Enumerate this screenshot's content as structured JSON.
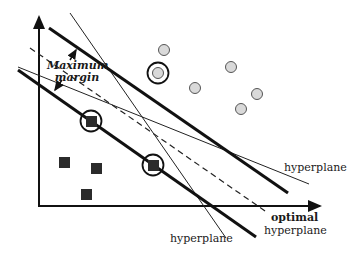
{
  "diagram": {
    "labels": {
      "max_margin_line1": "Maximum",
      "max_margin_line2": "margin",
      "hyperplane_right": "hyperplane",
      "hyperplane_bottom": "hyperplane",
      "optimal": "optimal",
      "optimal_hyperplane": "hyperplane"
    },
    "colors": {
      "line": "#111111",
      "circle_fill": "#d9d9d9",
      "circle_stroke": "#555555",
      "square_fill": "#2b2b2b"
    },
    "class_circles": [
      {
        "x": 164,
        "y": 50
      },
      {
        "x": 231,
        "y": 67
      },
      {
        "x": 195,
        "y": 88
      },
      {
        "x": 257,
        "y": 94
      },
      {
        "x": 241,
        "y": 109
      },
      {
        "x": 158,
        "y": 73,
        "support_vector": true
      }
    ],
    "class_squares": [
      {
        "x": 65,
        "y": 163
      },
      {
        "x": 96,
        "y": 168
      },
      {
        "x": 86,
        "y": 194
      },
      {
        "x": 91,
        "y": 121,
        "support_vector": true
      },
      {
        "x": 153,
        "y": 165,
        "support_vector": true
      }
    ]
  }
}
